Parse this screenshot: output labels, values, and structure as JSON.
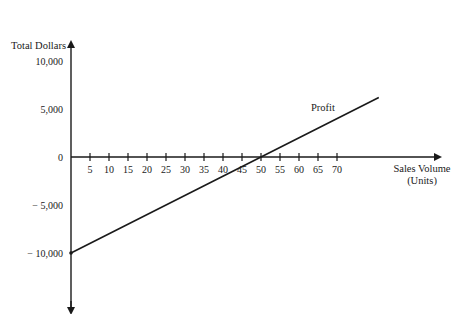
{
  "chart_data": {
    "type": "line",
    "title": "",
    "ylabel": "Total Dollars",
    "xlabel": "Sales Volume (Units)",
    "xlabel_lines": [
      "Sales Volume",
      "(Units)"
    ],
    "x_ticks": [
      5,
      10,
      15,
      20,
      25,
      30,
      35,
      40,
      45,
      50,
      55,
      60,
      65,
      70
    ],
    "y_ticks": [
      {
        "value": 10000,
        "label": "10,000"
      },
      {
        "value": 5000,
        "label": "5,000"
      },
      {
        "value": 0,
        "label": "0"
      },
      {
        "value": -5000,
        "label": "− 5,000"
      },
      {
        "value": -10000,
        "label": "− 10,000"
      }
    ],
    "series": [
      {
        "name": "Profit",
        "x": [
          0,
          50,
          81
        ],
        "y": [
          -10000,
          0,
          6200
        ]
      }
    ],
    "annotations": [
      {
        "text": "Profit",
        "x": 62,
        "y": 3200
      }
    ],
    "xlim": [
      0,
      100
    ],
    "ylim": [
      -15000,
      12000
    ],
    "grid": false,
    "legend": "none"
  }
}
